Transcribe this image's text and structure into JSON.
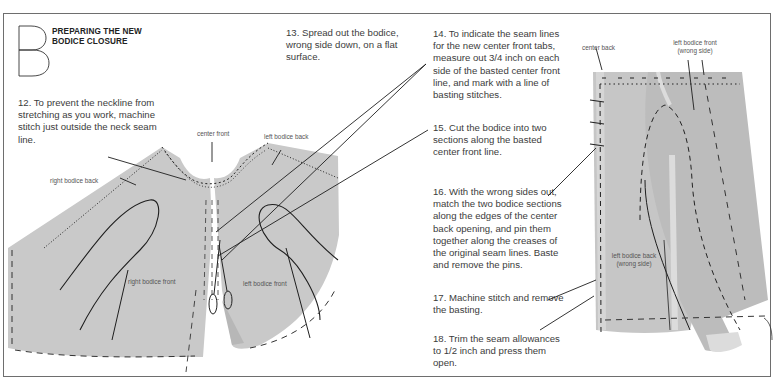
{
  "section": {
    "letter": "B",
    "title_line1": "PREPARING THE NEW",
    "title_line2": "BODICE CLOSURE"
  },
  "steps": [
    {
      "number": "12",
      "text": "12. To prevent the neckline from stretching as you work, machine stitch just outside the neck seam line."
    },
    {
      "number": "13",
      "text": "13. Spread out the bodice, wrong side down, on a flat surface."
    },
    {
      "number": "14",
      "text": "14. To indicate the seam lines for the new center front tabs, measure out 3/4 inch on each side of the basted center front line, and mark with a line of basting stitches."
    },
    {
      "number": "15",
      "text": "15. Cut the bodice into two sections along the basted center front line."
    },
    {
      "number": "16",
      "text": "16. With the wrong sides out, match the two bodice sections along the edges of the center back opening, and pin them together along the creases of the original seam lines. Baste and remove the pins."
    },
    {
      "number": "17",
      "text": "17. Machine stitch and remove the basting."
    },
    {
      "number": "18",
      "text": "18. Trim the seam allowances to 1/2 inch and press them open."
    }
  ],
  "figure_left": {
    "labels": {
      "right_bodice_back": "right bodice back",
      "center_front": "center front",
      "left_bodice_back": "left bodice back",
      "right_bodice_front": "right bodice front",
      "left_bodice_front": "left bodice front"
    }
  },
  "figure_right": {
    "labels": {
      "center_back": "center back",
      "left_bodice_front_l1": "left bodice front",
      "left_bodice_front_l2": "(wrong side)",
      "left_bodice_back_l1": "left bodice back",
      "left_bodice_back_l2": "(wrong side)"
    }
  },
  "colors": {
    "fabric": "#c9c9c9",
    "fabric_light": "#dcdcdc",
    "line": "#1e1e1e",
    "frame": "#6e6e6e"
  }
}
